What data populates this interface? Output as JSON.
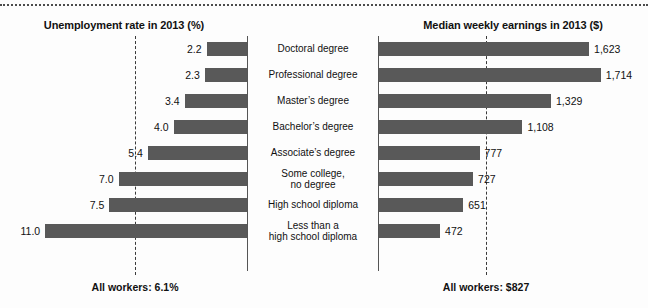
{
  "chart_data": {
    "type": "bar",
    "title": "",
    "orientation": "horizontal",
    "grid": false,
    "legend": null,
    "categories": [
      "Doctoral degree",
      "Professional degree",
      "Master's degree",
      "Bachelor's degree",
      "Associate's degree",
      "Some college,\nno degree",
      "High school diploma",
      "Less than a\nhigh school diploma"
    ],
    "panels": [
      {
        "id": "unemployment",
        "title": "Unemployment rate in 2013 (%)",
        "direction": "left",
        "xlabel": "",
        "ylabel": "",
        "xlim": [
          0,
          11.5
        ],
        "values": [
          2.2,
          2.3,
          3.4,
          4.0,
          5.4,
          7.0,
          7.5,
          11.0
        ],
        "value_labels": [
          "2.2",
          "2.3",
          "3.4",
          "4.0",
          "5.4",
          "7.0",
          "7.5",
          "11.0"
        ],
        "reference_line": {
          "value": 6.1,
          "label": "All workers: 6.1%",
          "style": "dashed"
        }
      },
      {
        "id": "earnings",
        "title": "Median weekly earnings in 2013 ($)",
        "direction": "right",
        "xlabel": "",
        "ylabel": "",
        "xlim": [
          0,
          1800
        ],
        "values": [
          1623,
          1714,
          1329,
          1108,
          777,
          727,
          651,
          472
        ],
        "value_labels": [
          "1,623",
          "1,714",
          "1,329",
          "1,108",
          "777",
          "727",
          "651",
          "472"
        ],
        "reference_line": {
          "value": 827,
          "label": "All workers: $827",
          "style": "dashed"
        }
      }
    ],
    "colors": {
      "bar": "#595959",
      "text": "#111111",
      "reference_line": "#3a3a3a",
      "axis": "#555555",
      "background": "#fdfdfd"
    }
  },
  "rows": [
    {
      "category": "Doctoral degree",
      "category_line1": "Doctoral degree",
      "category_line2": "",
      "unemployment": 2.2,
      "unemployment_label": "2.2",
      "earnings": 1623,
      "earnings_label": "1,623"
    },
    {
      "category": "Professional degree",
      "category_line1": "Professional degree",
      "category_line2": "",
      "unemployment": 2.3,
      "unemployment_label": "2.3",
      "earnings": 1714,
      "earnings_label": "1,714"
    },
    {
      "category": "Master's degree",
      "category_line1": "Master’s degree",
      "category_line2": "",
      "unemployment": 3.4,
      "unemployment_label": "3.4",
      "earnings": 1329,
      "earnings_label": "1,329"
    },
    {
      "category": "Bachelor's degree",
      "category_line1": "Bachelor’s degree",
      "category_line2": "",
      "unemployment": 4.0,
      "unemployment_label": "4.0",
      "earnings": 1108,
      "earnings_label": "1,108"
    },
    {
      "category": "Associate's degree",
      "category_line1": "Associate’s degree",
      "category_line2": "",
      "unemployment": 5.4,
      "unemployment_label": "5.4",
      "earnings": 777,
      "earnings_label": "777"
    },
    {
      "category": "Some college, no degree",
      "category_line1": "Some college,",
      "category_line2": "no degree",
      "unemployment": 7.0,
      "unemployment_label": "7.0",
      "earnings": 727,
      "earnings_label": "727"
    },
    {
      "category": "High school diploma",
      "category_line1": "High school diploma",
      "category_line2": "",
      "unemployment": 7.5,
      "unemployment_label": "7.5",
      "earnings": 651,
      "earnings_label": "651"
    },
    {
      "category": "Less than a high school diploma",
      "category_line1": "Less than a",
      "category_line2": "high school diploma",
      "unemployment": 11.0,
      "unemployment_label": "11.0",
      "earnings": 472,
      "earnings_label": "472"
    }
  ],
  "left_panel": {
    "title": "Unemployment rate in 2013 (%)",
    "average_label": "All workers: 6.1%"
  },
  "right_panel": {
    "title": "Median weekly earnings in 2013 ($)",
    "average_label": "All workers: $827"
  }
}
